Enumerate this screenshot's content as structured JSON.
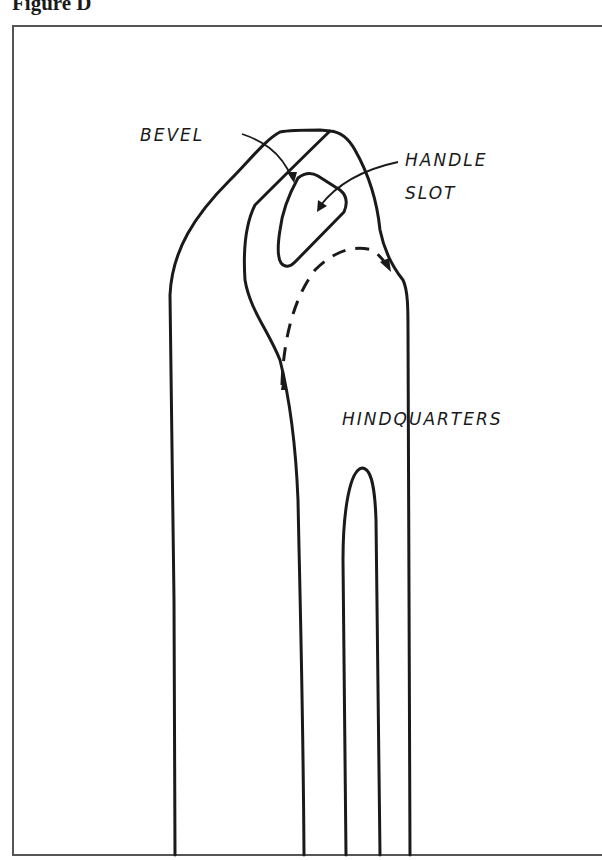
{
  "figure": {
    "title": "Figure D"
  },
  "labels": {
    "bevel": "BEVEL",
    "handle_slot_line1": "HANDLE",
    "handle_slot_line2": "SLOT",
    "hindquarters": "HINDQUARTERS"
  },
  "colors": {
    "ink": "#1a1a1a",
    "frame": "#555555",
    "background": "#ffffff"
  }
}
